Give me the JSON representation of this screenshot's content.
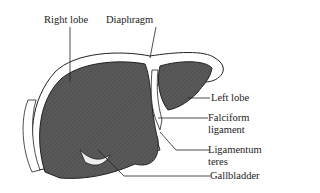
{
  "diagram": {
    "labels": {
      "right_lobe": "Right lobe",
      "diaphragm": "Diaphragm",
      "left_lobe": "Left lobe",
      "falciform_1": "Falciform",
      "falciform_2": "ligament",
      "ligamentum_1": "Ligamentum",
      "ligamentum_2": "teres",
      "gallbladder": "Gallbladder"
    },
    "colors": {
      "organ_fill": "#555555",
      "outline": "#222222",
      "background": "#ffffff"
    }
  }
}
